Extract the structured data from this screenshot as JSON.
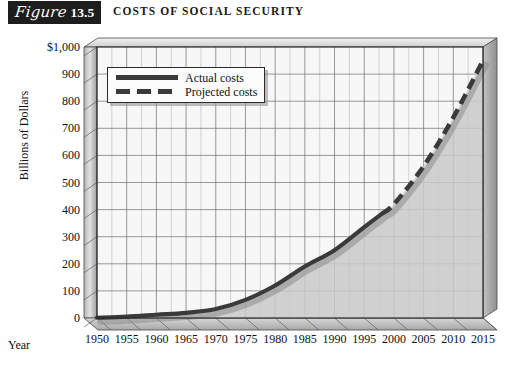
{
  "figure": {
    "badge_word": "Figure",
    "badge_number": "13.5",
    "title": "COSTS OF SOCIAL SECURITY"
  },
  "axes": {
    "ylabel": "Billions of Dollars",
    "xlabel": "Year",
    "yticks": [
      "$1,000",
      "900",
      "800",
      "700",
      "600",
      "500",
      "400",
      "300",
      "200",
      "100",
      "0"
    ],
    "xticks": [
      "1950",
      "1955",
      "1960",
      "1965",
      "1970",
      "1975",
      "1980",
      "1985",
      "1990",
      "1995",
      "2000",
      "2005",
      "2010",
      "2015"
    ]
  },
  "legend": {
    "actual": "Actual costs",
    "projected": "Projected costs"
  },
  "colors": {
    "line": "#3a3a3a",
    "area_fill": "#c9c9c9",
    "grid": "#6f6f6f",
    "frame": "#2b2b2b",
    "badge_bg": "#1d1d1d",
    "text": "#111111"
  },
  "chart_data": {
    "type": "line",
    "title": "COSTS OF SOCIAL SECURITY",
    "xlabel": "Year",
    "ylabel": "Billions of Dollars",
    "xlim": [
      1950,
      2015
    ],
    "ylim": [
      0,
      1000
    ],
    "grid": true,
    "legend_position": "upper-left",
    "x": [
      1950,
      1955,
      1960,
      1965,
      1970,
      1975,
      1980,
      1985,
      1990,
      1995,
      1998,
      2000,
      2005,
      2010,
      2015
    ],
    "series": [
      {
        "name": "Actual costs",
        "style": "solid",
        "x": [
          1950,
          1955,
          1960,
          1965,
          1970,
          1975,
          1980,
          1985,
          1990,
          1995,
          1998
        ],
        "values": [
          1,
          5,
          12,
          19,
          33,
          67,
          120,
          190,
          250,
          335,
          385
        ]
      },
      {
        "name": "Projected costs",
        "style": "dashed",
        "x": [
          1998,
          2000,
          2005,
          2010,
          2015
        ],
        "values": [
          385,
          420,
          560,
          740,
          950
        ]
      }
    ],
    "annotations": []
  }
}
